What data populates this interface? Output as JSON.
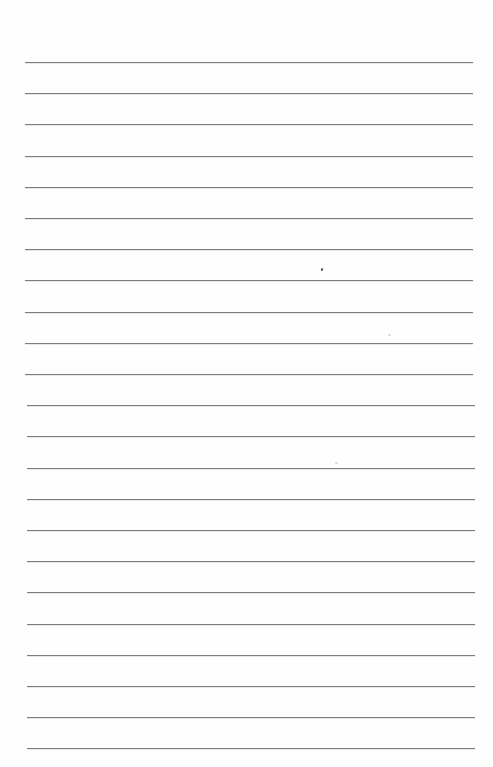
{
  "page": {
    "type": "lined-paper",
    "background": "#fefefe",
    "line_color": "#7d7d7d",
    "line_count": 23,
    "first_line_y": 62,
    "line_spacing": 31.2,
    "line_left": 25,
    "line_right": 473
  },
  "marks": [
    {
      "x": 321,
      "y": 268,
      "kind": "ink-speck"
    },
    {
      "x": 388,
      "y": 334,
      "kind": "faint-speck"
    },
    {
      "x": 335,
      "y": 462,
      "kind": "faint-speck"
    }
  ]
}
